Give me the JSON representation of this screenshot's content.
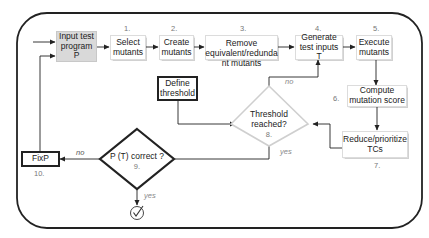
{
  "diagram": {
    "type": "flowchart",
    "title": "",
    "nodes": [
      {
        "id": "input",
        "label": "Input test program P",
        "line1": "Input test",
        "line2": "program P",
        "step": ""
      },
      {
        "id": "select",
        "label": "Select mutants",
        "line1": "Select",
        "line2": "mutants",
        "step": "1."
      },
      {
        "id": "create",
        "label": "Create mutants",
        "line1": "Create",
        "line2": "mutants",
        "step": "2."
      },
      {
        "id": "remove",
        "label": "Remove equivalent/redundant mutants",
        "line1": "Remove",
        "line2": "equivalent/redunda",
        "line3": "nt mutants",
        "step": "3."
      },
      {
        "id": "generate",
        "label": "Generate test inputs T",
        "line1": "Generate",
        "line2": "test inputs T",
        "step": "4."
      },
      {
        "id": "execute",
        "label": "Execute mutants",
        "line1": "Execute",
        "line2": "mutants",
        "step": "5."
      },
      {
        "id": "compute",
        "label": "Compute mutation score",
        "line1": "Compute",
        "line2": "mutation score",
        "step": "6."
      },
      {
        "id": "reduce",
        "label": "Reduce/prioritize TCs",
        "line1": "Reduce/prioritize",
        "line2": "TCs",
        "step": "7."
      },
      {
        "id": "threshold_decision",
        "label": "Threshold reached?",
        "line1": "Threshold",
        "line2": "reached?",
        "step": "8."
      },
      {
        "id": "correct_decision",
        "label": "P (T) correct ?",
        "line1": "P (T) correct ?",
        "step": "9."
      },
      {
        "id": "fix",
        "label": "Fix P",
        "line1": "FixP",
        "step": "10."
      },
      {
        "id": "define",
        "label": "Define threshold",
        "line1": "Define",
        "line2": "threshold",
        "step": ""
      }
    ],
    "edges": [
      {
        "from": "start",
        "to": "input",
        "label": ""
      },
      {
        "from": "input",
        "to": "select",
        "label": ""
      },
      {
        "from": "select",
        "to": "create",
        "label": ""
      },
      {
        "from": "create",
        "to": "remove",
        "label": ""
      },
      {
        "from": "remove",
        "to": "generate",
        "label": ""
      },
      {
        "from": "generate",
        "to": "execute",
        "label": ""
      },
      {
        "from": "execute",
        "to": "compute",
        "label": ""
      },
      {
        "from": "compute",
        "to": "reduce",
        "label": ""
      },
      {
        "from": "reduce",
        "to": "threshold_decision",
        "label": ""
      },
      {
        "from": "define",
        "to": "threshold_decision",
        "label": ""
      },
      {
        "from": "threshold_decision",
        "to": "generate",
        "label": "no"
      },
      {
        "from": "threshold_decision",
        "to": "correct_decision",
        "label": "yes"
      },
      {
        "from": "correct_decision",
        "to": "fix",
        "label": "no"
      },
      {
        "from": "correct_decision",
        "to": "done",
        "label": "yes"
      },
      {
        "from": "fix",
        "to": "input",
        "label": ""
      }
    ],
    "edge_labels": {
      "threshold_no": "no",
      "threshold_yes": "yes",
      "correct_no": "no",
      "correct_yes": "yes"
    },
    "end_icon": "check-circle-icon"
  }
}
